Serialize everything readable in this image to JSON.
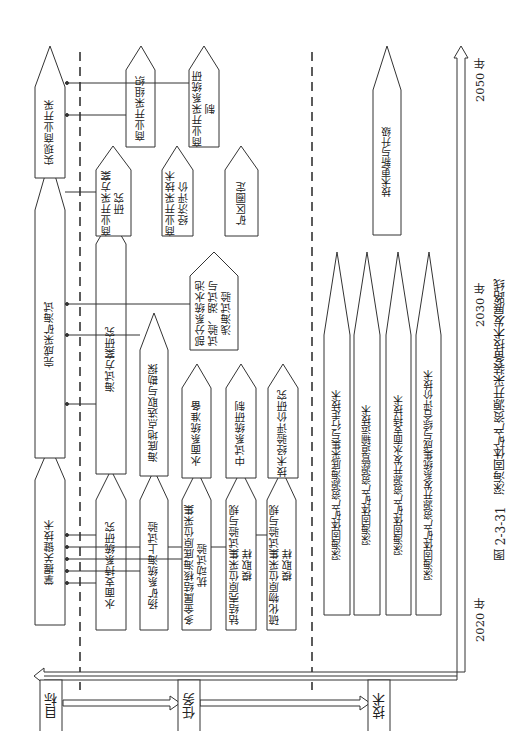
{
  "figure": {
    "caption_number": "图 2-3-31",
    "caption_title": "深海固体矿产资源开采装备技术发展路线",
    "timeline": {
      "years": [
        "2020 年",
        "2030 年",
        "2050 年"
      ]
    }
  },
  "legend": {
    "goal": "目标",
    "task": "任务",
    "tech": "技术"
  },
  "goals": [
    {
      "label": "掌握关键技术"
    },
    {
      "label": "完成采矿海试"
    },
    {
      "label": "实现商业开采"
    }
  ],
  "tasks_phase1": [
    {
      "label": "水面支持系统研究"
    },
    {
      "label": "扬矿系统海上试验"
    },
    {
      "label": "多金属结核海底原位采集扰动试验"
    },
    {
      "label": "钴结壳原位采集试验与规模取样"
    },
    {
      "label": "硫化物原位采集试验与规模取样"
    }
  ],
  "tasks_phase2": [
    {
      "label": "海试方案研究"
    },
    {
      "label": "海底地点选取与勘探"
    },
    {
      "label": "水面系统准备"
    },
    {
      "label": "中试系统研制"
    },
    {
      "label": "技术经验评价研究"
    },
    {
      "label": "部分系统水池试验、湖试与浅海试验"
    }
  ],
  "tasks_phase3": [
    {
      "label": "商业开采方案研究"
    },
    {
      "label": "商业开采组织"
    },
    {
      "label": "商业开采技术经济评价"
    },
    {
      "label": "商业开采系统研制"
    },
    {
      "label": "矿区圈定"
    }
  ],
  "technologies": [
    {
      "label": "深海固体矿产资源海底采集与行走技术"
    },
    {
      "label": "深海固体矿产资源管道输运技术"
    },
    {
      "label": "深海固体矿产资源开发水面支持技术"
    },
    {
      "label": "深海固体矿产资源开发系统集成与综合评价技术"
    },
    {
      "label": "技术更新与升级"
    }
  ],
  "colors": {
    "line": "#333333",
    "background": "#ffffff"
  }
}
